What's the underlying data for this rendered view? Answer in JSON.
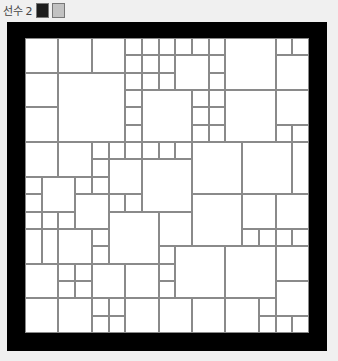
{
  "header": {
    "player_label": "선수 2",
    "swatches": [
      {
        "name": "player-color-dark",
        "color": "#1c1c1c"
      },
      {
        "name": "player-color-light",
        "color": "#c2c2c2"
      }
    ]
  },
  "board": {
    "grid_cols": 17,
    "grid_rows": 17,
    "frame_color": "#000000",
    "cell_color": "#ffffff",
    "line_color": "#8a8a8a",
    "cells": [
      [
        0,
        0,
        2,
        2
      ],
      [
        2,
        0,
        2,
        2
      ],
      [
        4,
        0,
        2,
        2
      ],
      [
        6,
        0,
        1,
        1
      ],
      [
        7,
        0,
        1,
        1
      ],
      [
        8,
        0,
        1,
        1
      ],
      [
        9,
        0,
        1,
        1
      ],
      [
        10,
        0,
        1,
        1
      ],
      [
        11,
        0,
        1,
        1
      ],
      [
        12,
        0,
        3,
        3
      ],
      [
        15,
        0,
        1,
        1
      ],
      [
        16,
        0,
        1,
        1
      ],
      [
        6,
        1,
        1,
        1
      ],
      [
        7,
        1,
        1,
        1
      ],
      [
        8,
        1,
        1,
        1
      ],
      [
        9,
        1,
        2,
        2
      ],
      [
        11,
        1,
        1,
        1
      ],
      [
        15,
        1,
        2,
        2
      ],
      [
        0,
        2,
        2,
        2
      ],
      [
        2,
        2,
        4,
        4
      ],
      [
        6,
        2,
        1,
        1
      ],
      [
        7,
        2,
        1,
        1
      ],
      [
        8,
        2,
        1,
        1
      ],
      [
        11,
        2,
        1,
        1
      ],
      [
        6,
        3,
        1,
        1
      ],
      [
        7,
        3,
        3,
        3
      ],
      [
        10,
        3,
        1,
        1
      ],
      [
        11,
        3,
        1,
        1
      ],
      [
        12,
        3,
        3,
        3
      ],
      [
        15,
        3,
        2,
        2
      ],
      [
        0,
        4,
        2,
        2
      ],
      [
        6,
        4,
        1,
        1
      ],
      [
        10,
        4,
        1,
        1
      ],
      [
        11,
        4,
        1,
        1
      ],
      [
        6,
        5,
        1,
        1
      ],
      [
        10,
        5,
        1,
        1
      ],
      [
        11,
        5,
        1,
        1
      ],
      [
        15,
        5,
        1,
        1
      ],
      [
        16,
        5,
        1,
        1
      ],
      [
        0,
        6,
        2,
        2
      ],
      [
        2,
        6,
        2,
        2
      ],
      [
        4,
        6,
        1,
        1
      ],
      [
        5,
        6,
        1,
        1
      ],
      [
        6,
        6,
        1,
        1
      ],
      [
        7,
        6,
        1,
        1
      ],
      [
        8,
        6,
        1,
        1
      ],
      [
        9,
        6,
        1,
        1
      ],
      [
        10,
        6,
        3,
        3
      ],
      [
        13,
        6,
        3,
        3
      ],
      [
        16,
        6,
        1,
        3
      ],
      [
        4,
        7,
        1,
        1
      ],
      [
        5,
        7,
        2,
        2
      ],
      [
        7,
        7,
        3,
        3
      ],
      [
        0,
        8,
        1,
        1
      ],
      [
        1,
        8,
        2,
        2
      ],
      [
        3,
        8,
        1,
        1
      ],
      [
        4,
        8,
        1,
        1
      ],
      [
        0,
        9,
        1,
        1
      ],
      [
        3,
        9,
        2,
        2
      ],
      [
        5,
        9,
        1,
        1
      ],
      [
        6,
        9,
        1,
        1
      ],
      [
        10,
        9,
        3,
        3
      ],
      [
        13,
        9,
        2,
        2
      ],
      [
        15,
        9,
        2,
        2
      ],
      [
        0,
        10,
        1,
        1
      ],
      [
        1,
        10,
        1,
        1
      ],
      [
        2,
        10,
        1,
        1
      ],
      [
        5,
        10,
        3,
        3
      ],
      [
        8,
        10,
        2,
        2
      ],
      [
        0,
        11,
        1,
        2
      ],
      [
        1,
        11,
        1,
        2
      ],
      [
        2,
        11,
        2,
        2
      ],
      [
        4,
        11,
        1,
        1
      ],
      [
        13,
        11,
        1,
        1
      ],
      [
        14,
        11,
        1,
        1
      ],
      [
        15,
        11,
        1,
        1
      ],
      [
        16,
        11,
        1,
        1
      ],
      [
        4,
        12,
        1,
        1
      ],
      [
        8,
        12,
        1,
        1
      ],
      [
        9,
        12,
        3,
        3
      ],
      [
        12,
        12,
        3,
        3
      ],
      [
        15,
        12,
        2,
        2
      ],
      [
        0,
        13,
        2,
        2
      ],
      [
        2,
        13,
        1,
        1
      ],
      [
        3,
        13,
        1,
        1
      ],
      [
        4,
        13,
        2,
        2
      ],
      [
        6,
        13,
        2,
        2
      ],
      [
        8,
        13,
        1,
        1
      ],
      [
        2,
        14,
        1,
        1
      ],
      [
        3,
        14,
        1,
        1
      ],
      [
        8,
        14,
        1,
        1
      ],
      [
        15,
        14,
        2,
        2
      ],
      [
        0,
        15,
        2,
        2
      ],
      [
        2,
        15,
        2,
        2
      ],
      [
        4,
        15,
        1,
        1
      ],
      [
        5,
        15,
        1,
        1
      ],
      [
        6,
        15,
        2,
        2
      ],
      [
        8,
        15,
        2,
        2
      ],
      [
        10,
        15,
        2,
        2
      ],
      [
        12,
        15,
        2,
        2
      ],
      [
        14,
        15,
        1,
        1
      ],
      [
        4,
        16,
        1,
        1
      ],
      [
        5,
        16,
        1,
        1
      ],
      [
        14,
        16,
        1,
        1
      ],
      [
        15,
        16,
        1,
        1
      ],
      [
        16,
        16,
        1,
        1
      ]
    ]
  }
}
